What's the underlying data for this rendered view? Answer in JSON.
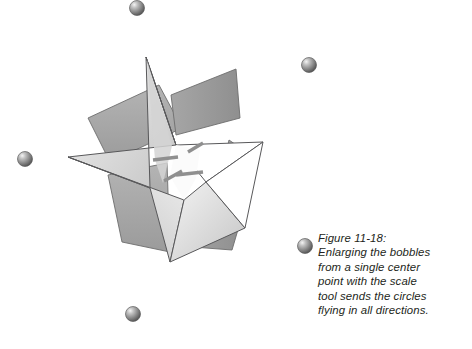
{
  "figure": {
    "label": "Figure 11-18:",
    "caption_lines": [
      "Figure 11-18:",
      "Enlarging the bobbles",
      "from a single center",
      "point with the scale",
      "tool sends the circles",
      "flying in all directions."
    ],
    "caption_full": "Figure 11-18: Enlarging the bobbles from a single center point with the scale tool sends the circles flying in all directions.",
    "alt": "A five-pointed star with extruded gray three-dimensional faces and gray motion dashes, surrounded by five small shaded spheres flying outward in all directions."
  },
  "colors": {
    "page_background": "#ffffff",
    "caption_text": "#231f20",
    "star_face_light": "#e9e9e9",
    "star_face_mid": "#c9c9c9",
    "star_face_dark": "#a8a8a8",
    "star_outline": "#58585a",
    "extrude_gray": "#a9a9a9",
    "extrude_gray_dark": "#949494",
    "bobble_body": "#8d8d8d",
    "bobble_shadow": "#4a4a4a",
    "bobble_highlight": "#f2f2f2",
    "dash_gray": "#8f8f8f"
  },
  "shapes": {
    "star_points": 5,
    "bobbles": [
      {
        "name": "bobble-top",
        "cx": 137,
        "cy": 8,
        "r": 7.5
      },
      {
        "name": "bobble-upper-right",
        "cx": 309,
        "cy": 65,
        "r": 7.5
      },
      {
        "name": "bobble-left",
        "cx": 25,
        "cy": 159,
        "r": 7.5
      },
      {
        "name": "bobble-caption",
        "cx": 305,
        "cy": 246,
        "r": 7.5
      },
      {
        "name": "bobble-bottom",
        "cx": 133,
        "cy": 314,
        "r": 7.5
      }
    ],
    "motion_dashes": [
      {
        "x1": 188,
        "y1": 152,
        "x2": 203,
        "y2": 143
      },
      {
        "x1": 153,
        "y1": 160,
        "x2": 178,
        "y2": 157
      },
      {
        "x1": 164,
        "y1": 181,
        "x2": 182,
        "y2": 171
      },
      {
        "x1": 176,
        "y1": 175,
        "x2": 203,
        "y2": 172
      }
    ]
  }
}
